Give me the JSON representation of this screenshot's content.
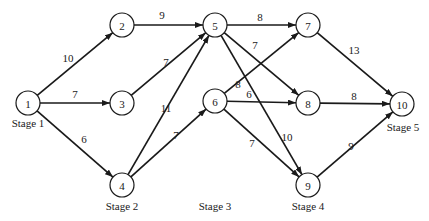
{
  "diagram": {
    "type": "staged-network",
    "node_radius": 12,
    "colors": {
      "stroke": "#1a1a1a",
      "background": "#ffffff"
    },
    "nodes": [
      {
        "id": "1",
        "label": "1",
        "x": 28,
        "y": 103
      },
      {
        "id": "2",
        "label": "2",
        "x": 122,
        "y": 25
      },
      {
        "id": "3",
        "label": "3",
        "x": 122,
        "y": 103
      },
      {
        "id": "4",
        "label": "4",
        "x": 122,
        "y": 185
      },
      {
        "id": "5",
        "label": "5",
        "x": 215,
        "y": 25
      },
      {
        "id": "6",
        "label": "6",
        "x": 215,
        "y": 101
      },
      {
        "id": "7",
        "label": "7",
        "x": 308,
        "y": 25
      },
      {
        "id": "8",
        "label": "8",
        "x": 308,
        "y": 103
      },
      {
        "id": "9",
        "label": "9",
        "x": 308,
        "y": 185
      },
      {
        "id": "10",
        "label": "10",
        "x": 402,
        "y": 104
      }
    ],
    "edges": [
      {
        "from": "1",
        "to": "2",
        "weight": "10",
        "lx": 68,
        "ly": 62
      },
      {
        "from": "1",
        "to": "3",
        "weight": "7",
        "lx": 75,
        "ly": 98
      },
      {
        "from": "1",
        "to": "4",
        "weight": "6",
        "lx": 84,
        "ly": 143
      },
      {
        "from": "2",
        "to": "5",
        "weight": "9",
        "lx": 162,
        "ly": 19
      },
      {
        "from": "3",
        "to": "5",
        "weight": "7",
        "lx": 166,
        "ly": 66
      },
      {
        "from": "4",
        "to": "5",
        "weight": "11",
        "lx": 166,
        "ly": 112
      },
      {
        "from": "4",
        "to": "6",
        "weight": "7",
        "lx": 176,
        "ly": 139
      },
      {
        "from": "5",
        "to": "7",
        "weight": "8",
        "lx": 260,
        "ly": 21
      },
      {
        "from": "5",
        "to": "8",
        "weight": "7",
        "lx": 255,
        "ly": 49
      },
      {
        "from": "5",
        "to": "9",
        "weight": "10",
        "lx": 287,
        "ly": 141
      },
      {
        "from": "6",
        "to": "7",
        "weight": "8",
        "lx": 238,
        "ly": 88
      },
      {
        "from": "6",
        "to": "8",
        "weight": "6",
        "lx": 249,
        "ly": 98
      },
      {
        "from": "6",
        "to": "9",
        "weight": "7",
        "lx": 252,
        "ly": 147
      },
      {
        "from": "7",
        "to": "10",
        "weight": "13",
        "lx": 354,
        "ly": 54
      },
      {
        "from": "8",
        "to": "10",
        "weight": "8",
        "lx": 354,
        "ly": 100
      },
      {
        "from": "9",
        "to": "10",
        "weight": "9",
        "lx": 351,
        "ly": 150
      }
    ],
    "stages": [
      {
        "label": "Stage 1",
        "x": 28,
        "y": 127
      },
      {
        "label": "Stage 2",
        "x": 122,
        "y": 210
      },
      {
        "label": "Stage 3",
        "x": 215,
        "y": 210
      },
      {
        "label": "Stage 4",
        "x": 308,
        "y": 210
      },
      {
        "label": "Stage 5",
        "x": 403,
        "y": 131
      }
    ]
  }
}
